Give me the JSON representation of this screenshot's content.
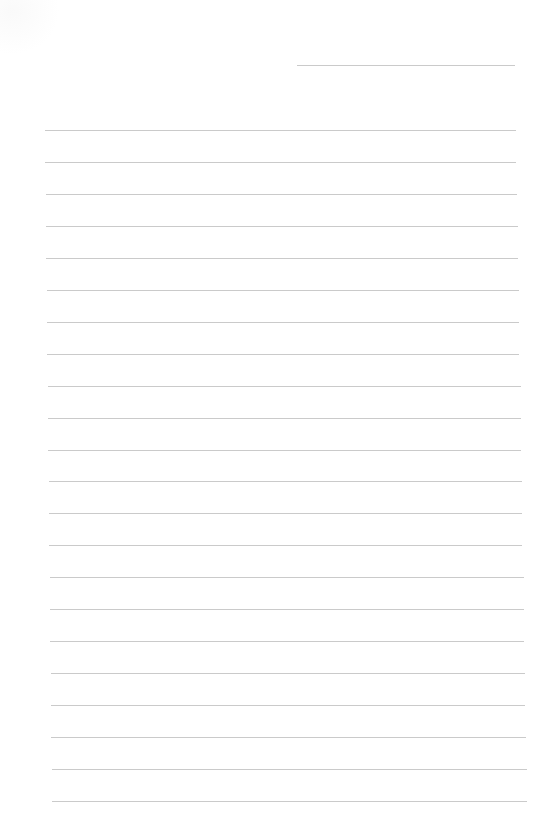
{
  "document": {
    "type": "lined-paper",
    "background_color": "#ffffff",
    "line_color": "#cacaca",
    "header_line": {
      "x1": 297,
      "x2": 515,
      "y": 65
    },
    "ruled_lines": {
      "count": 22,
      "first_y": 130,
      "spacing": 31.95,
      "left_start": 45,
      "left_end": 52,
      "right_start": 516,
      "right_end": 527
    },
    "text_content": []
  }
}
